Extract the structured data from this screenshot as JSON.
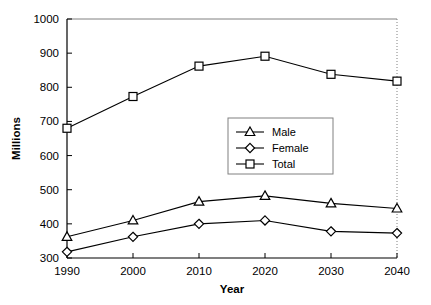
{
  "chart_data": {
    "type": "line",
    "title": "",
    "xlabel": "Year",
    "ylabel": "Millions",
    "x": [
      1990,
      2000,
      2010,
      2020,
      2030,
      2040
    ],
    "xtick_labels": [
      "1990",
      "2000",
      "2010",
      "2020",
      "2030",
      "2040"
    ],
    "ytick_labels": [
      "300",
      "400",
      "500",
      "600",
      "700",
      "800",
      "900",
      "1000"
    ],
    "ytick_values": [
      300,
      400,
      500,
      600,
      700,
      800,
      900,
      1000
    ],
    "ylim": [
      300,
      1000
    ],
    "xlim": [
      1990,
      2040
    ],
    "grid": false,
    "legend_position": "center",
    "series": [
      {
        "name": "Male",
        "marker": "triangle",
        "values": [
          362,
          410,
          465,
          482,
          460,
          445
        ]
      },
      {
        "name": "Female",
        "marker": "diamond",
        "values": [
          318,
          362,
          400,
          410,
          378,
          373
        ]
      },
      {
        "name": "Total",
        "marker": "square",
        "values": [
          680,
          773,
          862,
          891,
          838,
          818
        ]
      }
    ],
    "colors": {
      "line": "#000000",
      "marker_fill": "#ffffff",
      "axis": "#000000",
      "plot_border": "#000000",
      "background": "#ffffff"
    }
  },
  "legend": {
    "items": [
      {
        "label": "Male"
      },
      {
        "label": "Female"
      },
      {
        "label": "Total"
      }
    ]
  },
  "axes": {
    "y_title": "Millions",
    "x_title": "Year"
  }
}
